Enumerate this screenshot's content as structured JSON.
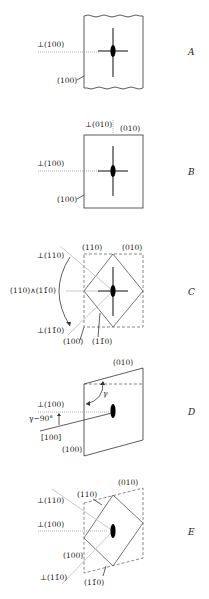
{
  "panels": [
    {
      "id": "A",
      "letter": "A",
      "labels": {
        "perp_100": "⊥(100)",
        "face_100": "(100)"
      }
    },
    {
      "id": "B",
      "letter": "B",
      "labels": {
        "perp_010": "⊥(010)",
        "face_010": "(010)",
        "perp_100": "⊥(100)",
        "face_100": "(100)"
      }
    },
    {
      "id": "C",
      "letter": "C",
      "labels": {
        "face_110": "(110)",
        "face_010": "(010)",
        "perp_110": "⊥(110)",
        "angle_110_1m10": "(110)∧(11̄0)",
        "perp_1m10": "⊥(11̄0)",
        "face_100": "(100)",
        "face_1m10": "(11̄0)"
      }
    },
    {
      "id": "D",
      "letter": "D",
      "labels": {
        "face_010": "(010)",
        "gamma": "γ",
        "perp_100": "⊥(100)",
        "gamma_minus_90": "γ−90°",
        "axis_100": "[100]",
        "face_100": "(100)"
      }
    },
    {
      "id": "E",
      "letter": "E",
      "labels": {
        "face_010": "(010)",
        "face_110": "(110)",
        "perp_110": "⊥(110)",
        "perp_100": "⊥(100)",
        "face_100": "(100)",
        "perp_1m10": "⊥(11̄0)",
        "face_1m10": "(11̄0)"
      }
    }
  ]
}
